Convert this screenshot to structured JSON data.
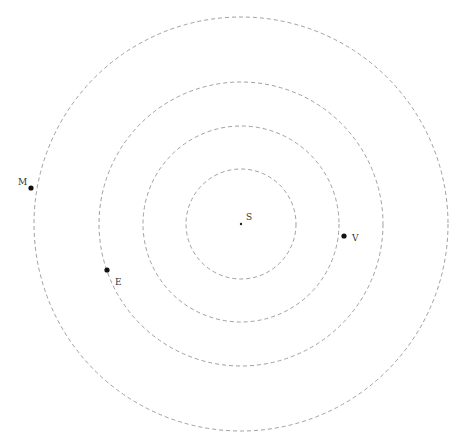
{
  "diagram": {
    "type": "orbital-diagram",
    "center": {
      "x": 241,
      "y": 224
    },
    "orbit_color": "#a0a0a0",
    "sun": {
      "label": "S",
      "x": 241,
      "y": 224
    },
    "orbits": [
      {
        "name": "orbit-1",
        "radius": 55
      },
      {
        "name": "orbit-2",
        "radius": 98
      },
      {
        "name": "orbit-3",
        "radius": 142
      },
      {
        "name": "orbit-4",
        "radius": 207
      }
    ],
    "bodies": [
      {
        "label": "V",
        "x": 344,
        "y": 236,
        "label_x": 352,
        "label_y": 241
      },
      {
        "label": "E",
        "x": 107,
        "y": 270,
        "label_x": 115,
        "label_y": 285
      },
      {
        "label": "M",
        "x": 31,
        "y": 188,
        "label_x": 18,
        "label_y": 185
      }
    ]
  }
}
